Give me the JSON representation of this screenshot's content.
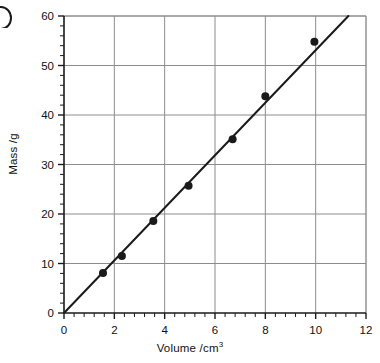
{
  "figure": {
    "corner_mark": "partial-letter-glyph",
    "background_color": "#ffffff",
    "ink_color": "#1a1a1a",
    "grid_color": "#8c8c8c"
  },
  "chart_data": {
    "type": "scatter",
    "title": "",
    "subtitle": "",
    "xlabel": "Volume /cm3",
    "xlabel_base": "Volume /cm",
    "xlabel_sup": "3",
    "ylabel": "Mass /g",
    "xlim": [
      0,
      12
    ],
    "ylim": [
      0,
      60
    ],
    "xticks": [
      0,
      2,
      4,
      6,
      8,
      10,
      12
    ],
    "yticks": [
      0,
      10,
      20,
      30,
      40,
      50,
      60
    ],
    "xtick_labels": [
      "0",
      "2",
      "4",
      "6",
      "8",
      "10",
      "12"
    ],
    "ytick_labels": [
      "0",
      "10",
      "20",
      "30",
      "40",
      "50",
      "60"
    ],
    "x_minor_step": 0.4,
    "y_minor_step": 2,
    "grid": true,
    "grid_major_only": true,
    "legend": "none",
    "marker": "filled-circle",
    "marker_size_px": 8,
    "x": [
      1.55,
      2.3,
      3.55,
      4.95,
      6.7,
      8.0,
      9.95
    ],
    "y": [
      8.1,
      11.5,
      18.6,
      25.7,
      35.1,
      43.8,
      54.8
    ],
    "points": [
      {
        "x": 1.55,
        "y": 8.1
      },
      {
        "x": 2.3,
        "y": 11.5
      },
      {
        "x": 3.55,
        "y": 18.6
      },
      {
        "x": 4.95,
        "y": 25.7
      },
      {
        "x": 6.7,
        "y": 35.1
      },
      {
        "x": 8.0,
        "y": 43.8
      },
      {
        "x": 9.95,
        "y": 54.8
      }
    ],
    "series": [
      {
        "name": "measurements",
        "type": "scatter",
        "values": [
          8.1,
          11.5,
          18.6,
          25.7,
          35.1,
          43.8,
          54.8
        ]
      },
      {
        "name": "best-fit-line",
        "type": "line",
        "through_origin": true,
        "slope": 5.31,
        "intercept": 0,
        "x_start": 0,
        "y_start": 0,
        "x_end": 11.3,
        "y_end": 60
      }
    ]
  }
}
